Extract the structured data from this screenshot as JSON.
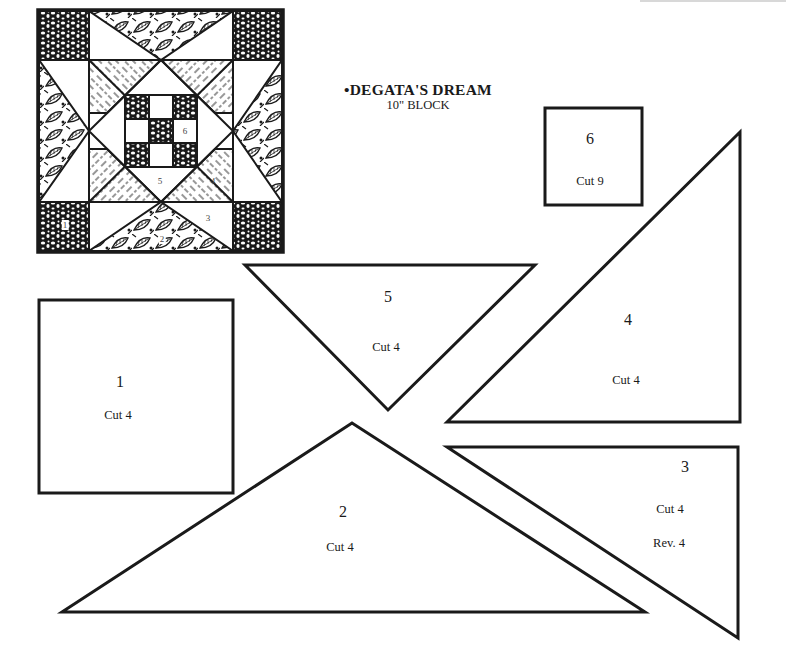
{
  "title": {
    "main": "•DEGATA'S DREAM",
    "sub": "10\" BLOCK"
  },
  "block_diagram": {
    "labels": [
      "1",
      "2",
      "3",
      "4",
      "5",
      "6"
    ]
  },
  "pieces": [
    {
      "id": "1",
      "number": "1",
      "shape": "square",
      "cut": "Cut 4"
    },
    {
      "id": "2",
      "number": "2",
      "shape": "triangle",
      "cut": "Cut 4"
    },
    {
      "id": "3",
      "number": "3",
      "shape": "right-triangle",
      "cut": "Cut 4",
      "reverse": "Rev. 4"
    },
    {
      "id": "4",
      "number": "4",
      "shape": "right-triangle",
      "cut": "Cut 4"
    },
    {
      "id": "5",
      "number": "5",
      "shape": "triangle",
      "cut": "Cut 4"
    },
    {
      "id": "6",
      "number": "6",
      "shape": "square",
      "cut": "Cut 9"
    }
  ],
  "colors": {
    "ink": "#1a1a1a",
    "paper": "#ffffff"
  }
}
